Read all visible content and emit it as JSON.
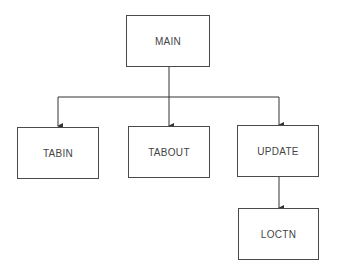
{
  "diagram": {
    "type": "hierarchy-chart",
    "nodes": {
      "main": "MAIN",
      "tabin": "TABIN",
      "tabout": "TABOUT",
      "update": "UPDATE",
      "loctn": "LOCTN"
    },
    "edges": [
      {
        "from": "MAIN",
        "to": "TABIN"
      },
      {
        "from": "MAIN",
        "to": "TABOUT"
      },
      {
        "from": "MAIN",
        "to": "UPDATE"
      },
      {
        "from": "UPDATE",
        "to": "LOCTN"
      }
    ]
  }
}
